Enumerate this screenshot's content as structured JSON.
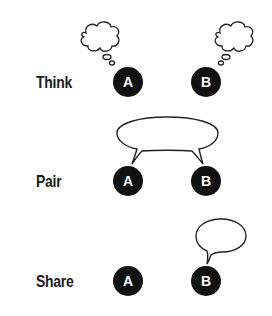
{
  "diagram": {
    "colors": {
      "node_fill": "#111111",
      "node_text": "#ffffff",
      "stroke": "#222222",
      "background": "#ffffff"
    },
    "rows": [
      {
        "label": "Think",
        "nodes": [
          {
            "letter": "A",
            "bubble": "thought"
          },
          {
            "letter": "B",
            "bubble": "thought"
          }
        ]
      },
      {
        "label": "Pair",
        "nodes": [
          {
            "letter": "A"
          },
          {
            "letter": "B"
          }
        ],
        "bubble": "shared-speech"
      },
      {
        "label": "Share",
        "nodes": [
          {
            "letter": "A"
          },
          {
            "letter": "B",
            "bubble": "speech"
          }
        ]
      }
    ]
  }
}
